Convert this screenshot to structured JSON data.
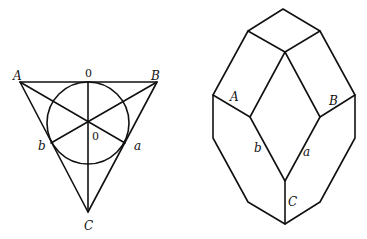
{
  "left_figure": {
    "description": "Triangle with inscribed circle and lines through center",
    "labels": {
      "A": "A",
      "B": "B",
      "C": "C",
      "a": "a",
      "b": "b",
      "top_zero": "0",
      "center_zero": "0"
    }
  },
  "right_figure": {
    "description": "Crystal-like polyhedron drawing",
    "labels": {
      "A": "A",
      "B": "B",
      "C": "C",
      "a": "a",
      "b": "b"
    }
  }
}
